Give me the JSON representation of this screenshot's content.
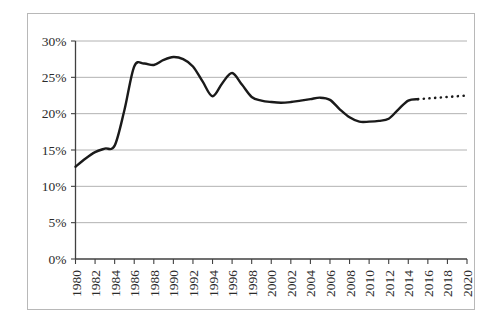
{
  "chart_data": {
    "type": "line",
    "title": "",
    "subtitle": "",
    "xlabel": "",
    "ylabel": "",
    "xlim": [
      1980,
      2020
    ],
    "ylim": [
      0,
      0.3
    ],
    "grid": true,
    "legend": null,
    "y_tick_labels": [
      "30%",
      "25%",
      "20%",
      "15%",
      "10%",
      "5%",
      "0%"
    ],
    "y_tick_values": [
      0.3,
      0.25,
      0.2,
      0.15,
      0.1,
      0.05,
      0.0
    ],
    "x_tick_labels": [
      "1980",
      "1982",
      "1984",
      "1986",
      "1988",
      "1990",
      "1992",
      "1994",
      "1996",
      "1998",
      "2000",
      "2002",
      "2004",
      "2006",
      "2008",
      "2010",
      "2012",
      "2014",
      "2016",
      "2018",
      "2020"
    ],
    "x_tick_values": [
      1980,
      1982,
      1984,
      1986,
      1988,
      1990,
      1992,
      1994,
      1996,
      1998,
      2000,
      2002,
      2004,
      2006,
      2008,
      2010,
      2012,
      2014,
      2016,
      2018,
      2020
    ],
    "series": [
      {
        "name": "historical",
        "style": "solid",
        "x": [
          1980,
          1981,
          1982,
          1983,
          1984,
          1985,
          1986,
          1987,
          1988,
          1989,
          1990,
          1991,
          1992,
          1993,
          1994,
          1995,
          1996,
          1997,
          1998,
          1999,
          2000,
          2001,
          2002,
          2003,
          2004,
          2005,
          2006,
          2007,
          2008,
          2009,
          2010,
          2011,
          2012,
          2013,
          2014,
          2015
        ],
        "values": [
          12.7,
          13.8,
          14.7,
          15.2,
          15.6,
          20.5,
          26.5,
          26.9,
          26.7,
          27.4,
          27.8,
          27.5,
          26.5,
          24.4,
          22.4,
          24.2,
          25.6,
          24.0,
          22.3,
          21.8,
          21.6,
          21.5,
          21.6,
          21.8,
          22.0,
          22.2,
          21.9,
          20.6,
          19.5,
          18.9,
          18.9,
          19.0,
          19.3,
          20.6,
          21.8,
          22.0
        ]
      },
      {
        "name": "projection",
        "style": "dotted",
        "x": [
          2015,
          2016,
          2017,
          2018,
          2019,
          2020
        ],
        "values": [
          22.0,
          22.1,
          22.2,
          22.3,
          22.4,
          22.5
        ]
      }
    ],
    "units": "percent"
  }
}
